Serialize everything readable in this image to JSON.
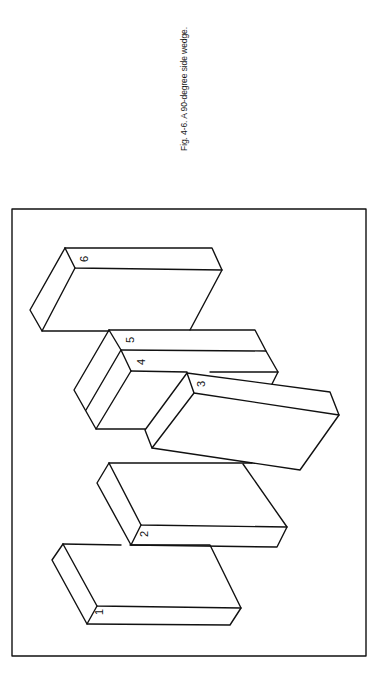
{
  "caption": "Fig. 4-6. A 90-degree side wedge.",
  "figure": {
    "stroke_color": "#111111",
    "labels": [
      "1",
      "2",
      "3",
      "4",
      "5",
      "6"
    ]
  }
}
